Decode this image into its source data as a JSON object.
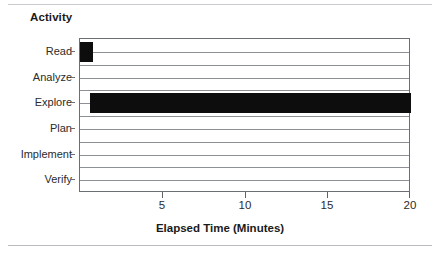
{
  "chart_data": {
    "type": "bar",
    "orientation": "horizontal",
    "title": "Activity",
    "xlabel": "Elapsed Time (Minutes)",
    "ylabel": "",
    "categories": [
      "Read",
      "Analyze",
      "Explore",
      "Plan",
      "Implement",
      "Verify"
    ],
    "values": [
      0.8,
      0,
      19.4,
      0,
      0,
      0
    ],
    "bar_starts": [
      0,
      0,
      0.6,
      0,
      0,
      0
    ],
    "bar_ends": [
      0.8,
      0,
      20,
      0,
      0,
      0
    ],
    "xlim": [
      0,
      20
    ],
    "xticks": [
      5,
      10,
      15,
      20
    ],
    "xticklabels": [
      "5",
      "10",
      "15",
      "20"
    ],
    "grid": "horizontal",
    "legend": "none",
    "bar_color": "#0d0d0d",
    "axis_color": "#6b6f74",
    "grid_color": "#8d9196",
    "background": "#ffffff"
  },
  "figure": {
    "title_text": "Activity",
    "xaxis_title_text": "Elapsed Time (Minutes)"
  }
}
